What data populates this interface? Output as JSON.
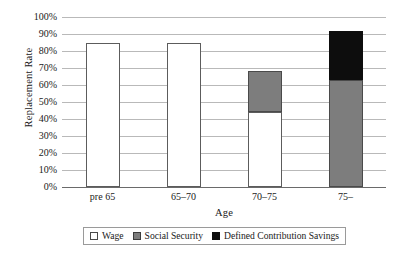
{
  "chart_data": {
    "type": "bar",
    "title": "",
    "xlabel": "Age",
    "ylabel": "Replacement Rate",
    "categories": [
      "pre 65",
      "65–70",
      "70–75",
      "75–"
    ],
    "ylim": [
      0,
      100
    ],
    "ytick_labels": [
      "0%",
      "10%",
      "20%",
      "30%",
      "40%",
      "50%",
      "60%",
      "70%",
      "80%",
      "90%",
      "100%"
    ],
    "ytick_values": [
      0,
      10,
      20,
      30,
      40,
      50,
      60,
      70,
      80,
      90,
      100
    ],
    "grid": true,
    "stacked": true,
    "legend_position": "bottom",
    "series": [
      {
        "name": "Wage",
        "color": "#ffffff",
        "values": [
          85,
          85,
          44,
          0
        ]
      },
      {
        "name": "Social Security",
        "color": "#7d7d7d",
        "values": [
          0,
          0,
          24,
          63
        ]
      },
      {
        "name": "Defined Contribution Savings",
        "color": "#0d0d0d",
        "values": [
          0,
          0,
          0,
          29
        ]
      }
    ],
    "totals": [
      85,
      85,
      68,
      92
    ]
  },
  "legend": {
    "items": [
      {
        "label": "Wage"
      },
      {
        "label": "Social Security"
      },
      {
        "label": "Defined Contribution Savings"
      }
    ]
  }
}
